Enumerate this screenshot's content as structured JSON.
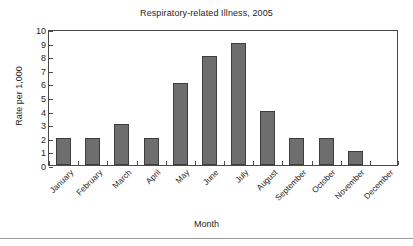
{
  "chart_data": {
    "type": "bar",
    "title": "Respiratory-related Illness, 2005",
    "xlabel": "Month",
    "ylabel": "Rate per 1,000",
    "categories": [
      "January",
      "February",
      "March",
      "April",
      "May",
      "June",
      "July",
      "August",
      "September",
      "October",
      "November",
      "December"
    ],
    "values": [
      2,
      2,
      3,
      2,
      6,
      8,
      9,
      4,
      2,
      2,
      1,
      0
    ],
    "ylim": [
      0,
      10
    ],
    "ytick_labels": [
      "0",
      "1",
      "2",
      "3",
      "4",
      "5",
      "6",
      "7",
      "8",
      "9",
      "10"
    ],
    "ytick_values": [
      0,
      1,
      2,
      3,
      4,
      5,
      6,
      7,
      8,
      9,
      10
    ],
    "grid": false,
    "legend": false,
    "bar_color": "#6e6e6e",
    "bar_edge_color": "#3d3d3d",
    "axis_color": "#4a4a4a",
    "background_color": "#ffffff"
  }
}
